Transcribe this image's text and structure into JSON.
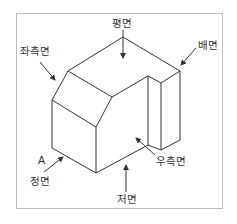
{
  "diagram": {
    "type": "isometric-projection-views",
    "top_cut_text": "",
    "labels": {
      "top": "평면",
      "left_side": "좌측면",
      "back": "배면",
      "right_side": "우측면",
      "point_a": "A",
      "front": "정면",
      "bottom": "저면"
    },
    "colors": {
      "line": "#333333",
      "frame": "#bdbdbd",
      "text": "#333333"
    }
  }
}
